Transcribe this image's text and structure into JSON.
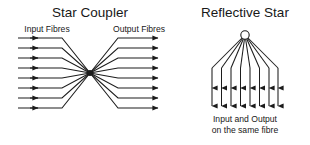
{
  "figure": {
    "background_color": "#ffffff",
    "ink_color": "#1c1c1c",
    "width": 310,
    "height": 145
  },
  "panels": [
    {
      "id": "star-coupler",
      "title": "Star Coupler",
      "title_x": 90,
      "title_y": 17,
      "labels": [
        {
          "name": "input-fibres-label",
          "text": "Input Fibres",
          "x": 47,
          "y": 32,
          "anchor": "middle"
        },
        {
          "name": "output-fibres-label",
          "text": "Output Fibres",
          "x": 139,
          "y": 32,
          "anchor": "middle"
        }
      ],
      "coupler": {
        "center_x": 90,
        "center_y": 73,
        "core_radius": 3.0,
        "fibre_count_in": 8,
        "fibre_count_out": 8,
        "input_line_start_x": 18,
        "input_arrow_x": 38,
        "input_bend_x": 62,
        "output_bend_x": 118,
        "output_line_end_x": 163,
        "output_arrow_x": 158,
        "fibre_y_values": [
          38,
          48,
          58,
          68,
          78,
          88,
          98,
          108
        ]
      }
    },
    {
      "id": "reflective-star",
      "title": "Reflective Star",
      "title_x": 245,
      "title_y": 17,
      "caption_lines": [
        {
          "name": "caption-line-1",
          "text": "Input and Output",
          "x": 245,
          "y": 122
        },
        {
          "name": "caption-line-2",
          "text": "on the same fibre",
          "x": 245,
          "y": 133
        }
      ],
      "star": {
        "apex_x": 245,
        "apex_y": 35,
        "node_radius": 4.2,
        "fibre_count": 8,
        "fan_bottom_y": 68,
        "arrow_mid_y": 88,
        "tail_bottom_y": 106,
        "fibre_x_values": [
          212,
          221.5,
          231,
          240.5,
          250,
          259.5,
          269,
          278
        ]
      }
    }
  ]
}
